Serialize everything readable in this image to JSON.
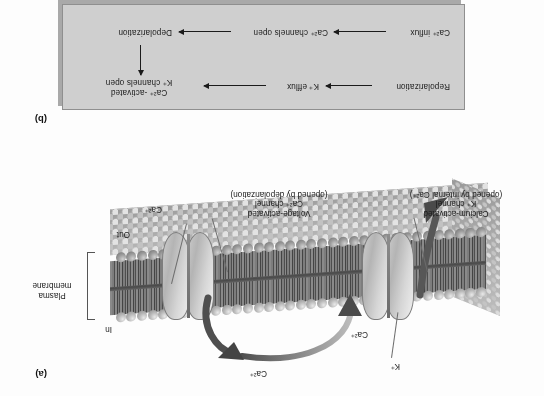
{
  "figure": {
    "orientation_note": "scanned page appears upside-down (rotated 180 degrees)",
    "panel_a_tag": "(a)",
    "panel_b_tag": "(b)"
  },
  "panel_a": {
    "title_implicit": "Plasma membrane with voltage-activated Ca2+ channel and calcium-activated K+ channel",
    "labels": {
      "voltage_channel_line1": "Voltage-activated",
      "voltage_channel_line2": "Ca²⁺ channel",
      "voltage_channel_line3": "(opened by depolarization)",
      "k_channel_line1": "Calcium-activated",
      "k_channel_line2": "K⁺ channel",
      "k_channel_line3": "(opened by internal Ca²⁺)",
      "membrane_line1": "Plasma",
      "membrane_line2": "membrane",
      "side_in": "In",
      "side_out": "Out",
      "ion_ca_outside": "Ca²⁺",
      "ion_ca_inside_top": "Ca²⁺",
      "ion_ca_inside_near_k": "Ca²⁺",
      "ion_k": "K⁺"
    }
  },
  "panel_b": {
    "flow_top": {
      "step1": "Repolarization",
      "step2": "K⁺ efflux",
      "step3_line1": "Ca²⁺ -activated",
      "step3_line2": "K⁺ channels open"
    },
    "flow_bottom": {
      "step1": "Depolarization",
      "step2": "Ca²⁺ channels open",
      "step3": "Ca²⁺ influx"
    }
  },
  "colors": {
    "panel_b_fill": "#cfcfcf",
    "panel_b_shadow": "#a9a9a9",
    "text": "#1b1b1b",
    "membrane_core": "#4e4e4e",
    "protein_fill": "#d6d6d6",
    "arrow_dark": "#4d4d4d"
  }
}
